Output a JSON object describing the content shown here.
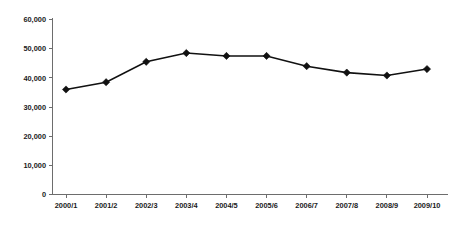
{
  "chart_data": {
    "type": "line",
    "title": "",
    "subtitle": "",
    "xlabel": "",
    "ylabel": "",
    "categories": [
      "2000/1",
      "2001/2",
      "2002/3",
      "2003/4",
      "2004/5",
      "2005/6",
      "2006/7",
      "2007/8",
      "2008/9",
      "2009/10"
    ],
    "values": [
      36000,
      38500,
      45500,
      48500,
      47500,
      47500,
      44000,
      41800,
      40800,
      43000
    ],
    "series": [
      {
        "name": "Series 1",
        "values": [
          36000,
          38500,
          45500,
          48500,
          47500,
          47500,
          44000,
          41800,
          40800,
          43000
        ],
        "marker": "diamond",
        "color": "#111111"
      }
    ],
    "ylim": [
      0,
      60000
    ],
    "ytick_values": [
      0,
      10000,
      20000,
      30000,
      40000,
      50000,
      60000
    ],
    "ytick_labels": [
      "0",
      "10,000",
      "20,000",
      "30,000",
      "40,000",
      "50,000",
      "60,000"
    ],
    "grid": false,
    "legend": false,
    "legend_position": "none",
    "annotations": []
  },
  "colors": {
    "background": "#ffffff",
    "axis": "#6d6d6d",
    "series": "#111111",
    "text": "#1a1a1a"
  }
}
